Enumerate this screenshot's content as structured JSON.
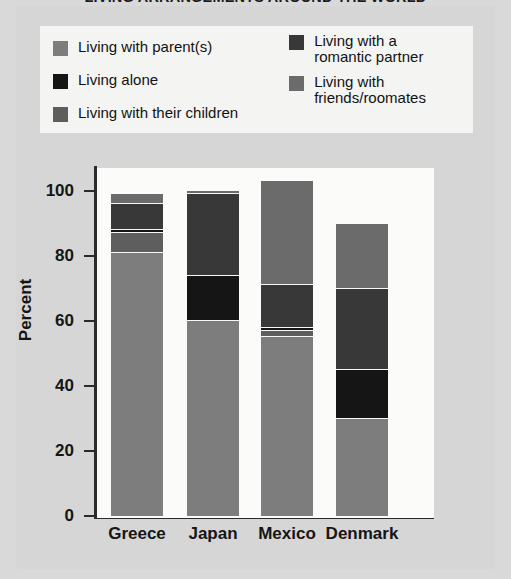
{
  "title": "LIVING ARRANGEMENTS AROUND THE WORLD",
  "colors": {
    "parents": "#7d7d7d",
    "alone": "#151515",
    "children": "#5e5e5e",
    "partner": "#383838",
    "roommates": "#6b6b6b",
    "axis": "#2b2b2b",
    "plot_bg": "#fbfbf9",
    "panel_bg": "#d6d6d6",
    "legend_bg": "#f4f4f2"
  },
  "legend": {
    "left": [
      {
        "key": "parents",
        "label": "Living with parent(s)"
      },
      {
        "key": "alone",
        "label": "Living alone"
      },
      {
        "key": "children",
        "label": "Living with their children"
      }
    ],
    "right": [
      {
        "key": "partner",
        "label": "Living with a\nromantic partner"
      },
      {
        "key": "roommates",
        "label": "Living with\nfriends/roomates"
      }
    ]
  },
  "chart_data": {
    "type": "bar",
    "stacked": true,
    "title": "LIVING ARRANGEMENTS AROUND THE WORLD",
    "xlabel": "",
    "ylabel": "Percent",
    "categories": [
      "Greece",
      "Japan",
      "Mexico",
      "Denmark"
    ],
    "ylim": [
      0,
      110
    ],
    "yticks": [
      0,
      20,
      40,
      60,
      80,
      100
    ],
    "ytick_labels": [
      "0",
      "20",
      "40",
      "60",
      "80",
      "100"
    ],
    "grid": false,
    "legend_position": "top",
    "series": [
      {
        "name": "Living with parent(s)",
        "key": "parents",
        "values": [
          81,
          60,
          55,
          30
        ]
      },
      {
        "name": "Living with their children",
        "key": "children",
        "values": [
          6,
          0,
          2,
          0
        ]
      },
      {
        "name": "Living alone",
        "key": "alone",
        "values": [
          1,
          14,
          1,
          15
        ]
      },
      {
        "name": "Living with a romantic partner",
        "key": "partner",
        "values": [
          8,
          25,
          13,
          25
        ]
      },
      {
        "name": "Living with friends/roomates",
        "key": "roommates",
        "values": [
          3,
          1,
          32,
          20
        ]
      }
    ],
    "totals": [
      99,
      100,
      103,
      90
    ]
  },
  "axis": {
    "ylabel": "Percent",
    "ticks": [
      {
        "value": 100,
        "label": "100"
      },
      {
        "value": 80,
        "label": "80"
      },
      {
        "value": 60,
        "label": "60"
      },
      {
        "value": 40,
        "label": "40"
      },
      {
        "value": 20,
        "label": "20"
      },
      {
        "value": 0,
        "label": "0"
      }
    ]
  }
}
